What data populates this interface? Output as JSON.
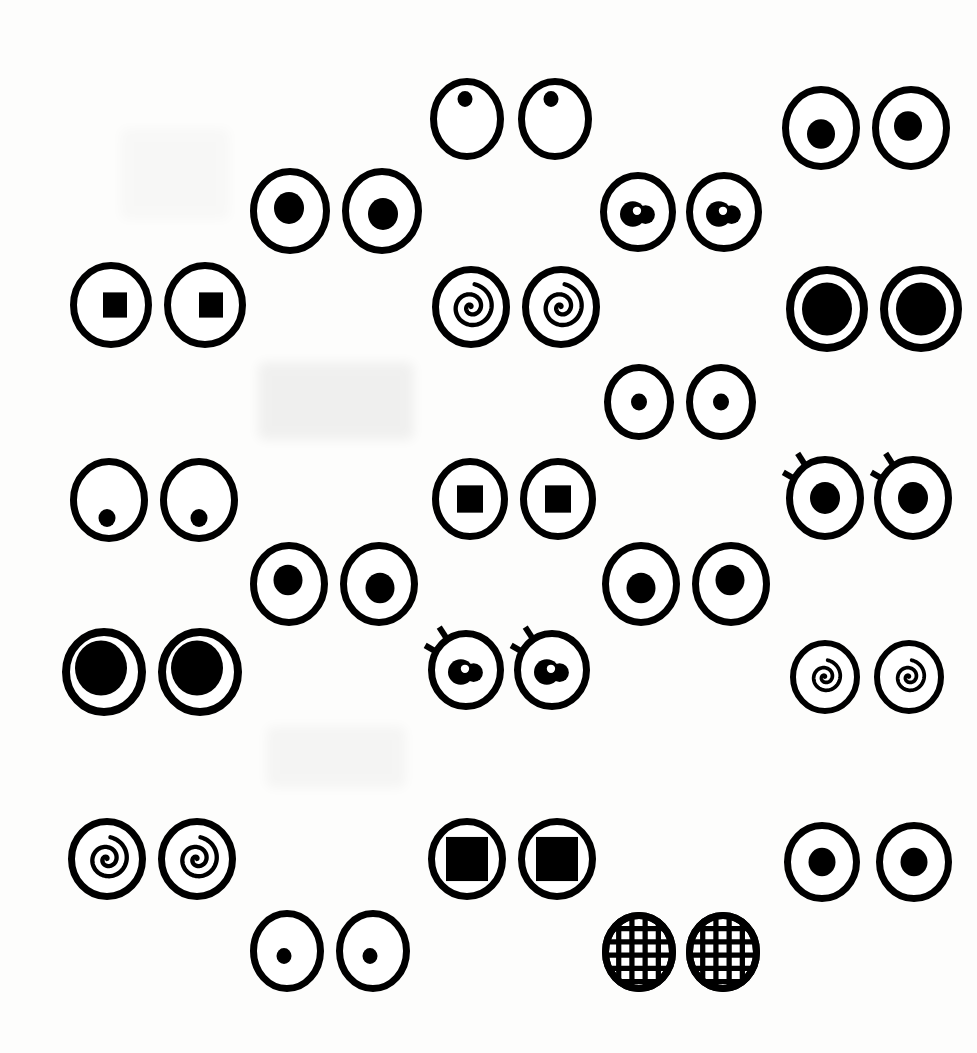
{
  "page": {
    "width": 977,
    "height": 1053,
    "background_color": "#fdfdfc",
    "ink_color": "#000000",
    "paper_color": "#ffffff",
    "pair_count": 15,
    "eye_count": 30
  },
  "ghosts": [
    {
      "name": "ghost-smudge-upper",
      "x": 258,
      "y": 362,
      "w": 156,
      "h": 78,
      "opacity": 0.05
    },
    {
      "name": "ghost-smudge-lower",
      "x": 266,
      "y": 726,
      "w": 140,
      "h": 62,
      "opacity": 0.03
    },
    {
      "name": "ghost-smudge-left",
      "x": 120,
      "y": 128,
      "w": 110,
      "h": 92,
      "opacity": 0.02
    }
  ],
  "pairs": [
    {
      "id": "pair-01-tiny-dot-high",
      "label": "Tiny high dot pupils",
      "row": 1,
      "column": "center",
      "x": 430,
      "y": 78,
      "eye_w": 74,
      "eye_h": 82,
      "gap": 14,
      "stroke": 7,
      "pupil_type": "dot",
      "pupil_size": 15,
      "lashes": false,
      "left_pupil_offset": {
        "dx": -2,
        "dy": -20
      },
      "right_pupil_offset": {
        "dx": -4,
        "dy": -20
      }
    },
    {
      "id": "pair-02-medium-dot-top-right",
      "label": "Medium offset pupils",
      "row": 1,
      "column": "right",
      "x": 782,
      "y": 86,
      "eye_w": 78,
      "eye_h": 84,
      "gap": 12,
      "stroke": 7,
      "pupil_type": "dot",
      "pupil_size": 28,
      "lashes": false,
      "left_pupil_offset": {
        "dx": 0,
        "dy": 6
      },
      "right_pupil_offset": {
        "dx": -3,
        "dy": -2
      }
    },
    {
      "id": "pair-03-medium-dot-left",
      "label": "Medium centered pupils",
      "row": 2,
      "column": "left-center",
      "x": 250,
      "y": 168,
      "eye_w": 80,
      "eye_h": 86,
      "gap": 12,
      "stroke": 7,
      "pupil_type": "dot",
      "pupil_size": 30,
      "lashes": false,
      "left_pupil_offset": {
        "dx": -1,
        "dy": -3
      },
      "right_pupil_offset": {
        "dx": 1,
        "dy": 3
      }
    },
    {
      "id": "pair-04-blob-highlight",
      "label": "Blob pupils with white highlight",
      "row": 2,
      "column": "center-right",
      "x": 600,
      "y": 172,
      "eye_w": 76,
      "eye_h": 80,
      "gap": 10,
      "stroke": 7,
      "pupil_type": "blob-highlight",
      "pupil_size": 32,
      "lashes": false,
      "left_pupil_offset": {
        "dx": -2,
        "dy": 2
      },
      "right_pupil_offset": {
        "dx": -2,
        "dy": 2
      }
    },
    {
      "id": "pair-05-square-small",
      "label": "Small square pupils",
      "row": 3,
      "column": "left",
      "x": 70,
      "y": 262,
      "eye_w": 82,
      "eye_h": 86,
      "gap": 12,
      "stroke": 7,
      "pupil_type": "square",
      "pupil_size": 24,
      "lashes": false,
      "left_pupil_offset": {
        "dx": 4,
        "dy": 0
      },
      "right_pupil_offset": {
        "dx": 6,
        "dy": 0
      }
    },
    {
      "id": "pair-06-spiral-large",
      "label": "Large counter-clockwise spiral pupils",
      "row": 3,
      "column": "center",
      "x": 432,
      "y": 266,
      "eye_w": 78,
      "eye_h": 82,
      "gap": 12,
      "stroke": 7,
      "pupil_type": "spiral",
      "pupil_size": 46,
      "lashes": false,
      "left_pupil_offset": {
        "dx": 0,
        "dy": 0
      },
      "right_pupil_offset": {
        "dx": 0,
        "dy": 0
      }
    },
    {
      "id": "pair-07-huge-pupil-right",
      "label": "Extra large filled pupils",
      "row": 3,
      "column": "right",
      "x": 786,
      "y": 266,
      "eye_w": 82,
      "eye_h": 86,
      "gap": 12,
      "stroke": 8,
      "pupil_type": "dot",
      "pupil_size": 50,
      "lashes": false,
      "left_pupil_offset": {
        "dx": 0,
        "dy": 0
      },
      "right_pupil_offset": {
        "dx": 0,
        "dy": 0
      }
    },
    {
      "id": "pair-08-small-dot-center",
      "label": "Small centered dot pupils",
      "row": 4,
      "column": "center-right",
      "x": 604,
      "y": 364,
      "eye_w": 70,
      "eye_h": 76,
      "gap": 12,
      "stroke": 7,
      "pupil_type": "dot",
      "pupil_size": 16,
      "lashes": false,
      "left_pupil_offset": {
        "dx": 0,
        "dy": 0
      },
      "right_pupil_offset": {
        "dx": 0,
        "dy": 0
      }
    },
    {
      "id": "pair-09-tiny-dot-low",
      "label": "Tiny low dot pupils",
      "row": 5,
      "column": "left",
      "x": 70,
      "y": 458,
      "eye_w": 78,
      "eye_h": 84,
      "gap": 12,
      "stroke": 7,
      "pupil_type": "dot",
      "pupil_size": 17,
      "lashes": false,
      "left_pupil_offset": {
        "dx": -2,
        "dy": 18
      },
      "right_pupil_offset": {
        "dx": 0,
        "dy": 18
      }
    },
    {
      "id": "pair-10-square-medium",
      "label": "Medium square pupils",
      "row": 5,
      "column": "center",
      "x": 432,
      "y": 458,
      "eye_w": 76,
      "eye_h": 82,
      "gap": 12,
      "stroke": 7,
      "pupil_type": "square",
      "pupil_size": 26,
      "lashes": false,
      "left_pupil_offset": {
        "dx": 0,
        "dy": 0
      },
      "right_pupil_offset": {
        "dx": 0,
        "dy": 0
      }
    },
    {
      "id": "pair-11-lashes-dot",
      "label": "Lashed eyes with round pupils",
      "row": 5,
      "column": "right",
      "x": 786,
      "y": 456,
      "eye_w": 78,
      "eye_h": 84,
      "gap": 10,
      "stroke": 7,
      "pupil_type": "dot",
      "pupil_size": 30,
      "lashes": true,
      "left_pupil_offset": {
        "dx": 0,
        "dy": 0
      },
      "right_pupil_offset": {
        "dx": 0,
        "dy": 0
      }
    },
    {
      "id": "pair-12-medium-dot-lower-left",
      "label": "Medium dot pupils lower row",
      "row": 6,
      "column": "left-center",
      "x": 250,
      "y": 542,
      "eye_w": 78,
      "eye_h": 84,
      "gap": 12,
      "stroke": 7,
      "pupil_type": "dot",
      "pupil_size": 29,
      "lashes": false,
      "left_pupil_offset": {
        "dx": -1,
        "dy": -4
      },
      "right_pupil_offset": {
        "dx": 1,
        "dy": 4
      }
    },
    {
      "id": "pair-13-medium-dot-lower-center",
      "label": "Medium dot pupils lower centre",
      "row": 6,
      "column": "center-right",
      "x": 602,
      "y": 542,
      "eye_w": 78,
      "eye_h": 84,
      "gap": 12,
      "stroke": 7,
      "pupil_type": "dot",
      "pupil_size": 29,
      "lashes": false,
      "left_pupil_offset": {
        "dx": 0,
        "dy": 4
      },
      "right_pupil_offset": {
        "dx": -1,
        "dy": -4
      }
    },
    {
      "id": "pair-14-huge-pupil-left",
      "label": "Extra large filled pupils left",
      "row": 7,
      "column": "left",
      "x": 62,
      "y": 628,
      "eye_w": 84,
      "eye_h": 88,
      "gap": 12,
      "stroke": 8,
      "pupil_type": "dot",
      "pupil_size": 52,
      "lashes": false,
      "left_pupil_offset": {
        "dx": -3,
        "dy": -4
      },
      "right_pupil_offset": {
        "dx": -3,
        "dy": -4
      }
    },
    {
      "id": "pair-15-lashes-blob",
      "label": "Lashed eyes with blob highlight pupils",
      "row": 7,
      "column": "center",
      "x": 428,
      "y": 630,
      "eye_w": 76,
      "eye_h": 80,
      "gap": 10,
      "stroke": 7,
      "pupil_type": "blob-highlight",
      "pupil_size": 32,
      "lashes": true,
      "left_pupil_offset": {
        "dx": -2,
        "dy": 2
      },
      "right_pupil_offset": {
        "dx": -2,
        "dy": 2
      }
    },
    {
      "id": "pair-16-spiral-small-right",
      "label": "Small spiral pupils right",
      "row": 7,
      "column": "right",
      "x": 790,
      "y": 640,
      "eye_w": 70,
      "eye_h": 74,
      "gap": 14,
      "stroke": 6,
      "pupil_type": "spiral",
      "pupil_size": 34,
      "lashes": false,
      "left_pupil_offset": {
        "dx": 0,
        "dy": 0
      },
      "right_pupil_offset": {
        "dx": 0,
        "dy": 0
      }
    },
    {
      "id": "pair-17-spiral-bottom-left",
      "label": "Spiral pupils bottom left",
      "row": 8,
      "column": "left",
      "x": 68,
      "y": 818,
      "eye_w": 78,
      "eye_h": 82,
      "gap": 12,
      "stroke": 7,
      "pupil_type": "spiral",
      "pupil_size": 44,
      "lashes": false,
      "left_pupil_offset": {
        "dx": 0,
        "dy": 0
      },
      "right_pupil_offset": {
        "dx": 0,
        "dy": 0
      }
    },
    {
      "id": "pair-18-square-large",
      "label": "Large square pupils",
      "row": 8,
      "column": "center",
      "x": 428,
      "y": 818,
      "eye_w": 78,
      "eye_h": 82,
      "gap": 12,
      "stroke": 7,
      "pupil_type": "square",
      "pupil_size": 42,
      "lashes": false,
      "left_pupil_offset": {
        "dx": 0,
        "dy": 0
      },
      "right_pupil_offset": {
        "dx": 0,
        "dy": 0
      }
    },
    {
      "id": "pair-19-small-dot-bottom-right",
      "label": "Small dot pupils bottom right",
      "row": 8,
      "column": "right",
      "x": 784,
      "y": 822,
      "eye_w": 76,
      "eye_h": 80,
      "gap": 16,
      "stroke": 7,
      "pupil_type": "dot",
      "pupil_size": 27,
      "lashes": false,
      "left_pupil_offset": {
        "dx": 0,
        "dy": 0
      },
      "right_pupil_offset": {
        "dx": 0,
        "dy": 0
      }
    },
    {
      "id": "pair-20-tiny-dot-bottom",
      "label": "Tiny dot pupils bottom",
      "row": 9,
      "column": "left-center",
      "x": 250,
      "y": 910,
      "eye_w": 74,
      "eye_h": 82,
      "gap": 12,
      "stroke": 7,
      "pupil_type": "dot",
      "pupil_size": 15,
      "lashes": false,
      "left_pupil_offset": {
        "dx": -3,
        "dy": 5
      },
      "right_pupil_offset": {
        "dx": -3,
        "dy": 5
      }
    },
    {
      "id": "pair-21-mesh-grid",
      "label": "Crosshatch grid filled eyes",
      "row": 9,
      "column": "center-right",
      "x": 602,
      "y": 912,
      "eye_w": 74,
      "eye_h": 80,
      "gap": 10,
      "stroke": 7,
      "pupil_type": "mesh",
      "pupil_size": 0,
      "lashes": false,
      "left_pupil_offset": {
        "dx": 0,
        "dy": 0
      },
      "right_pupil_offset": {
        "dx": 0,
        "dy": 0
      }
    }
  ],
  "icon_names": {
    "dot": "filled-circle-pupil-icon",
    "square": "filled-square-pupil-icon",
    "spiral": "spiral-pupil-icon",
    "blob-highlight": "blob-highlight-pupil-icon",
    "mesh": "crosshatch-mesh-icon",
    "lashes": "eyelash-icon",
    "eye": "eye-outline-icon"
  }
}
